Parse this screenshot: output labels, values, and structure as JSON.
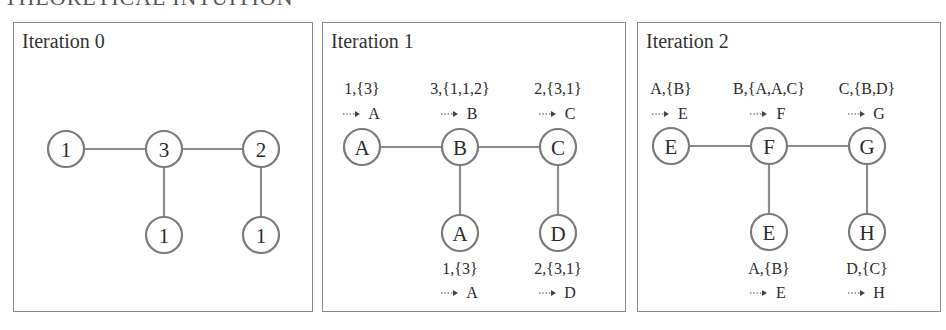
{
  "heading": "THEORETICAL INTUITION",
  "colors": {
    "border": "#8a8a8a",
    "edge": "#8c8c8c",
    "node_stroke": "#7a7a7a",
    "text": "#2b2b2b"
  },
  "panels": [
    {
      "title": "Iteration 0",
      "nodes": [
        {
          "id": "n1",
          "label": "1"
        },
        {
          "id": "n2",
          "label": "3"
        },
        {
          "id": "n3",
          "label": "2"
        },
        {
          "id": "n4",
          "label": "1"
        },
        {
          "id": "n5",
          "label": "1"
        }
      ],
      "edges": [
        [
          "n1",
          "n2"
        ],
        [
          "n2",
          "n3"
        ],
        [
          "n2",
          "n4"
        ],
        [
          "n3",
          "n5"
        ]
      ],
      "messages": []
    },
    {
      "title": "Iteration 1",
      "nodes": [
        {
          "id": "n1",
          "label": "A"
        },
        {
          "id": "n2",
          "label": "B"
        },
        {
          "id": "n3",
          "label": "C"
        },
        {
          "id": "n4",
          "label": "A"
        },
        {
          "id": "n5",
          "label": "D"
        }
      ],
      "edges": [
        [
          "n1",
          "n2"
        ],
        [
          "n2",
          "n3"
        ],
        [
          "n2",
          "n4"
        ],
        [
          "n3",
          "n5"
        ]
      ],
      "messages": [
        {
          "node": "n1",
          "signature": "1,{3}",
          "result": "A"
        },
        {
          "node": "n2",
          "signature": "3,{1,1,2}",
          "result": "B"
        },
        {
          "node": "n3",
          "signature": "2,{3,1}",
          "result": "C"
        },
        {
          "node": "n4",
          "signature": "1,{3}",
          "result": "A"
        },
        {
          "node": "n5",
          "signature": "2,{3,1}",
          "result": "D"
        }
      ]
    },
    {
      "title": "Iteration 2",
      "nodes": [
        {
          "id": "n1",
          "label": "E"
        },
        {
          "id": "n2",
          "label": "F"
        },
        {
          "id": "n3",
          "label": "G"
        },
        {
          "id": "n4",
          "label": "E"
        },
        {
          "id": "n5",
          "label": "H"
        }
      ],
      "edges": [
        [
          "n1",
          "n2"
        ],
        [
          "n2",
          "n3"
        ],
        [
          "n2",
          "n4"
        ],
        [
          "n3",
          "n5"
        ]
      ],
      "messages": [
        {
          "node": "n1",
          "signature": "A,{B}",
          "result": "E"
        },
        {
          "node": "n2",
          "signature": "B,{A,A,C}",
          "result": "F"
        },
        {
          "node": "n3",
          "signature": "C,{B,D}",
          "result": "G"
        },
        {
          "node": "n4",
          "signature": "A,{B}",
          "result": "E"
        },
        {
          "node": "n5",
          "signature": "D,{C}",
          "result": "H"
        }
      ]
    }
  ]
}
